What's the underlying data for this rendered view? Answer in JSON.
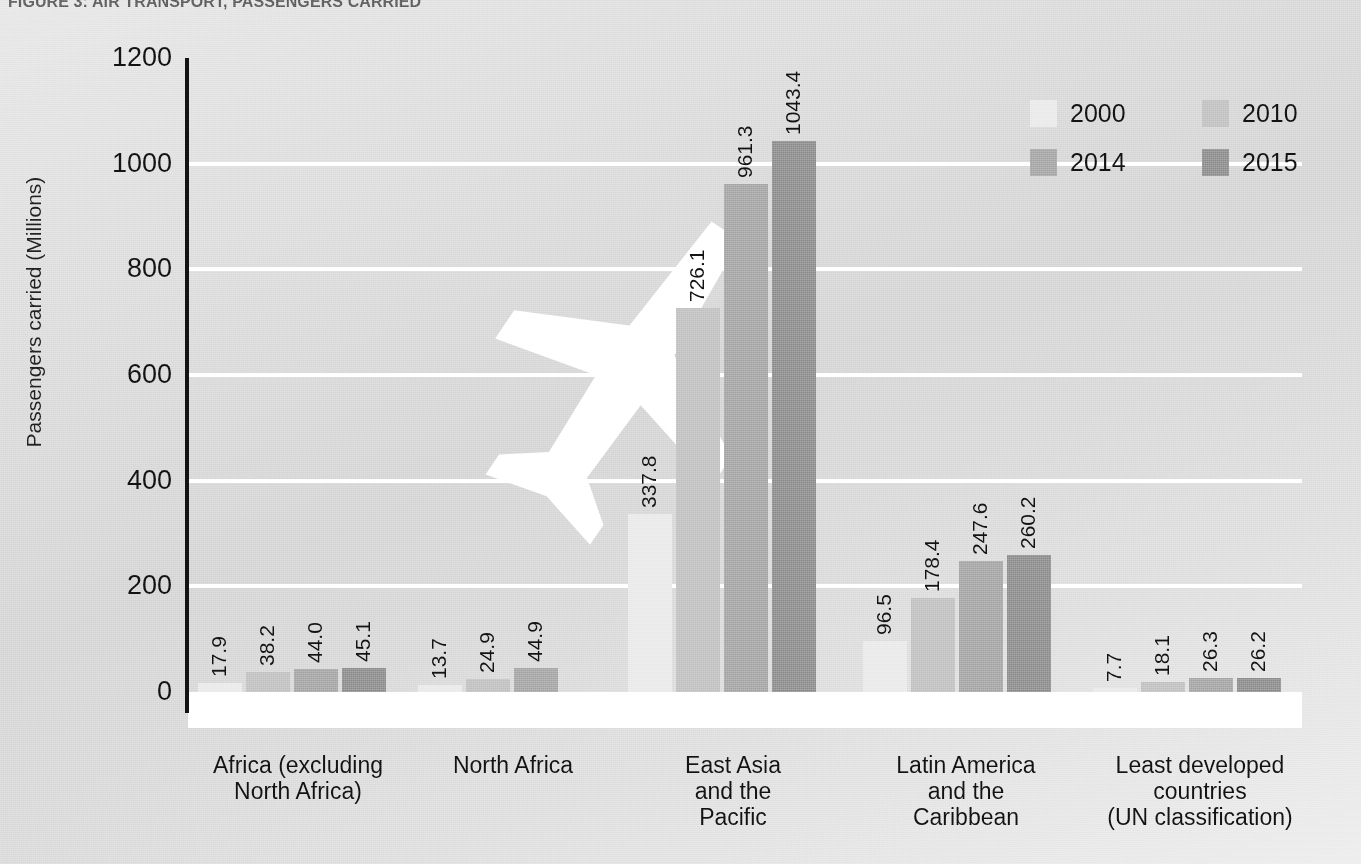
{
  "figure": {
    "title": "FIGURE 3:  AIR TRANSPORT, PASSENGERS CARRIED"
  },
  "axis": {
    "y_title": "Passengers carried (Millions)"
  },
  "legend": {
    "items": [
      {
        "label": "2000",
        "color": "#e9e9e9"
      },
      {
        "label": "2010",
        "color": "#bfbfbf"
      },
      {
        "label": "2014",
        "color": "#a3a3a3"
      },
      {
        "label": "2015",
        "color": "#8a8a8a"
      }
    ]
  },
  "watermark": {
    "name": "airplane-watermark",
    "color": "#ffffff"
  },
  "chart_data": {
    "type": "bar",
    "title": "FIGURE 3:  AIR TRANSPORT, PASSENGERS CARRIED",
    "xlabel": "",
    "ylabel": "Passengers carried (Millions)",
    "ylim": [
      0,
      1200
    ],
    "yticks": [
      0,
      200,
      400,
      600,
      800,
      1000,
      1200
    ],
    "ytick_labels": [
      "0",
      "200",
      "400",
      "600",
      "800",
      "1000",
      "1200"
    ],
    "grid": true,
    "legend_position": "top-right",
    "categories": [
      "Africa (excluding\nNorth Africa)",
      "North Africa",
      "East Asia\nand the\nPacific",
      "Latin America\nand the\nCaribbean",
      "Least developed\ncountries\n(UN classification)"
    ],
    "series": [
      {
        "name": "2000",
        "color": "#e9e9e9",
        "values": [
          17.9,
          13.7,
          337.8,
          96.5,
          7.7
        ]
      },
      {
        "name": "2010",
        "color": "#bfbfbf",
        "values": [
          38.2,
          24.9,
          726.1,
          178.4,
          18.1
        ]
      },
      {
        "name": "2014",
        "color": "#a3a3a3",
        "values": [
          44.0,
          44.9,
          961.3,
          247.6,
          26.3
        ]
      },
      {
        "name": "2015",
        "color": "#8a8a8a",
        "values": [
          45.1,
          null,
          1043.4,
          260.2,
          26.2
        ]
      }
    ],
    "value_labels": [
      [
        "17.9",
        "38.2",
        "44.0",
        "45.1"
      ],
      [
        "13.7",
        "24.9",
        "44.9"
      ],
      [
        "337.8",
        "726.1",
        "961.3",
        "1043.4"
      ],
      [
        "96.5",
        "178.4",
        "247.6",
        "260.2"
      ],
      [
        "7.7",
        "18.1",
        "26.3",
        "26.2"
      ]
    ]
  }
}
